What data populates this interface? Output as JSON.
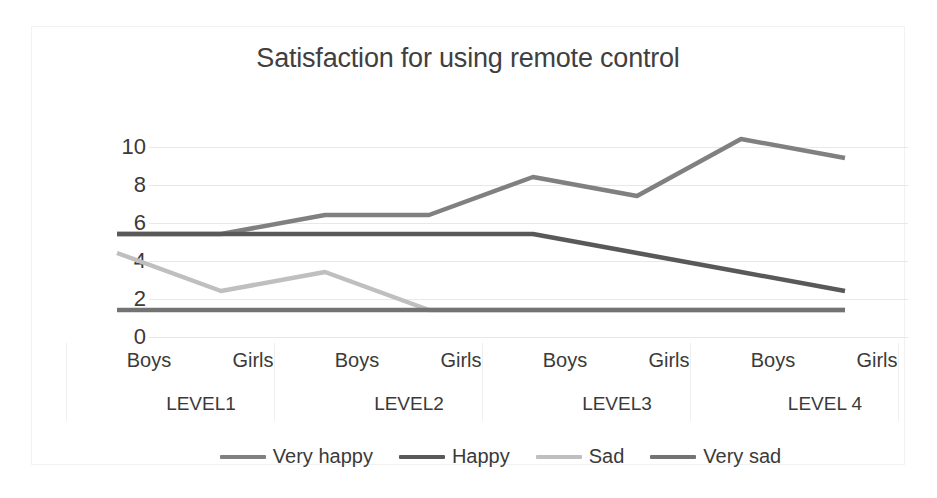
{
  "chart_data": {
    "type": "line",
    "title": "Satisfaction for using remote control",
    "xlabel": "",
    "ylabel": "",
    "ylim": [
      0,
      10
    ],
    "yticks": [
      "0",
      "2",
      "4",
      "6",
      "8",
      "10"
    ],
    "grid": true,
    "legend_position": "bottom",
    "categories": [
      "Boys",
      "Girls",
      "Boys",
      "Girls",
      "Boys",
      "Girls",
      "Boys",
      "Girls"
    ],
    "groups": [
      "LEVEL1",
      "LEVEL2",
      "LEVEL3",
      "LEVEL 4"
    ],
    "series": [
      {
        "name": "Very happy",
        "color": "#808080",
        "values": [
          4,
          4,
          5,
          5,
          7,
          6,
          9,
          8
        ]
      },
      {
        "name": "Happy",
        "color": "#595959",
        "values": [
          4,
          4,
          4,
          4,
          4,
          3,
          2,
          1
        ]
      },
      {
        "name": "Sad",
        "color": "#bfbfbf",
        "values": [
          3,
          1,
          2,
          0,
          0,
          0,
          0,
          0
        ]
      },
      {
        "name": "Very sad",
        "color": "#737373",
        "values": [
          0,
          0,
          0,
          0,
          0,
          0,
          0,
          0
        ]
      }
    ]
  },
  "colors": {
    "background": "#ffffff",
    "border": "#f2f2f2",
    "gridline": "#e8e8e8",
    "text": "#3a3a3a",
    "title": "#404040"
  }
}
